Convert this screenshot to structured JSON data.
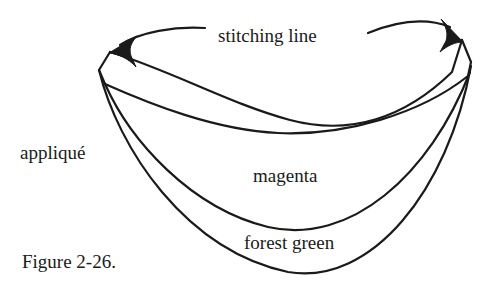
{
  "figure": {
    "caption": "Figure 2-26.",
    "background_color": "#ffffff",
    "ink_color": "#1a1a1a",
    "width": 501,
    "height": 300
  },
  "labels": {
    "stitching_line": "stitching line",
    "applique": "appliqué",
    "magenta": "magenta",
    "forest_green": "forest green"
  },
  "annotations": [
    {
      "name": "stitching-line-callout-left",
      "text": "stitching line",
      "points_to": "top-left-corner"
    },
    {
      "name": "stitching-line-callout-right",
      "text": "stitching line",
      "points_to": "top-right-corner"
    }
  ]
}
